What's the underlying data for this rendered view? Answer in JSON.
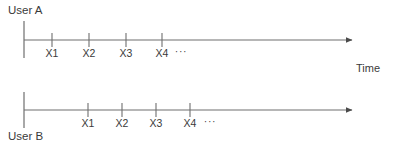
{
  "figure": {
    "type": "diagram",
    "subtype": "timeline",
    "background_color": "#ffffff",
    "line_color": "#6e6e6e",
    "text_color": "#3a3a3a",
    "axis_label": "Time"
  },
  "timelines": [
    {
      "id": "timeline-a",
      "user_label": "User A",
      "user_label_position": "above-left",
      "axis": {
        "x_start": 24,
        "x_end": 358,
        "y": 40
      },
      "start_bar": {
        "x": 24,
        "y_top": 21,
        "y_bottom": 58
      },
      "events": [
        {
          "label": "X1",
          "x": 52
        },
        {
          "label": "X2",
          "x": 89
        },
        {
          "label": "X3",
          "x": 126
        },
        {
          "label": "X4",
          "x": 162
        }
      ],
      "ellipsis": {
        "label": "···",
        "x": 181
      }
    },
    {
      "id": "timeline-b",
      "user_label": "User B",
      "user_label_position": "below-left",
      "axis": {
        "x_start": 24,
        "x_end": 358,
        "y": 110
      },
      "start_bar": {
        "x": 24,
        "y_top": 92,
        "y_bottom": 128
      },
      "events": [
        {
          "label": "X1",
          "x": 88
        },
        {
          "label": "X2",
          "x": 122
        },
        {
          "label": "X3",
          "x": 156
        },
        {
          "label": "X4",
          "x": 190
        }
      ],
      "ellipsis": {
        "label": "···",
        "x": 210
      }
    }
  ],
  "labels": {
    "user_a": "User A",
    "user_b": "User B",
    "time": "Time",
    "a_x1": "X1",
    "a_x2": "X2",
    "a_x3": "X3",
    "a_x4": "X4",
    "a_ellipsis": "···",
    "b_x1": "X1",
    "b_x2": "X2",
    "b_x3": "X3",
    "b_x4": "X4",
    "b_ellipsis": "···"
  }
}
